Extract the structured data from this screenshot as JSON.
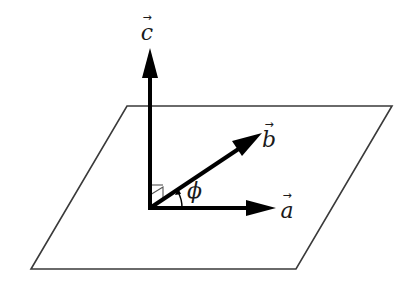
{
  "diagram": {
    "type": "vector-diagram",
    "colors": {
      "plane_stroke": "#3a3a3a",
      "vector_stroke": "#000000",
      "text": "#1a1a1a"
    },
    "plane": {
      "shape": "parallelogram",
      "corners": [
        [
          127,
          106
        ],
        [
          392,
          106
        ],
        [
          296,
          269
        ],
        [
          31,
          269
        ]
      ]
    },
    "origin": [
      150,
      208
    ],
    "vectors": [
      {
        "id": "a",
        "label": "a",
        "arrow": "→",
        "tip": [
          275,
          208
        ]
      },
      {
        "id": "b",
        "label": "b",
        "arrow": "→",
        "tip": [
          262,
          133
        ]
      },
      {
        "id": "c",
        "label": "c",
        "arrow": "→",
        "tip": [
          150,
          48
        ]
      }
    ],
    "angle": {
      "label": "ϕ",
      "between": [
        "a",
        "b"
      ]
    },
    "right_angle_marker": {
      "between": [
        "c",
        "b"
      ]
    }
  }
}
